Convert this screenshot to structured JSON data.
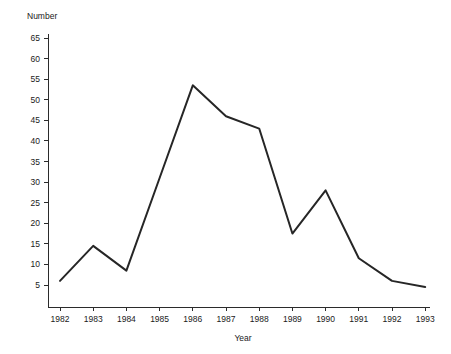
{
  "chart_data": {
    "type": "line",
    "title": "",
    "xlabel": "Year",
    "ylabel": "Number",
    "categories": [
      "1982",
      "1983",
      "1984",
      "1985",
      "1986",
      "1987",
      "1988",
      "1989",
      "1990",
      "1991",
      "1992",
      "1993"
    ],
    "x": [
      1982,
      1983,
      1984,
      1985,
      1986,
      1987,
      1988,
      1989,
      1990,
      1991,
      1992,
      1993
    ],
    "values": [
      6,
      14.5,
      8.5,
      31,
      53.5,
      46,
      43,
      17.5,
      28,
      11.5,
      6,
      4.5
    ],
    "series": [
      {
        "name": "Number",
        "values": [
          6,
          14.5,
          8.5,
          31,
          53.5,
          46,
          43,
          17.5,
          28,
          11.5,
          6,
          4.5
        ]
      }
    ],
    "ylim": [
      0,
      65
    ],
    "xlim": [
      1982,
      1993
    ],
    "yticks": [
      5,
      10,
      15,
      20,
      25,
      30,
      35,
      40,
      45,
      50,
      55,
      60,
      65
    ],
    "ytick_labels": [
      "5",
      "10",
      "15",
      "20",
      "25",
      "30",
      "35",
      "40",
      "45",
      "50",
      "55",
      "60",
      "65"
    ],
    "xticks": [
      1982,
      1983,
      1984,
      1985,
      1986,
      1987,
      1988,
      1989,
      1990,
      1991,
      1992,
      1993
    ],
    "xtick_labels": [
      "1982",
      "1983",
      "1984",
      "1985",
      "1986",
      "1987",
      "1988",
      "1989",
      "1990",
      "1991",
      "1992",
      "1993"
    ],
    "grid": false,
    "legend": false,
    "legend_position": "none",
    "markers": false,
    "line_color": "#262626",
    "background_color": "#ffffff",
    "axis_color": "#2b2b2b"
  },
  "labels": {
    "y_axis_title": "Number",
    "x_axis_title": "Year"
  }
}
